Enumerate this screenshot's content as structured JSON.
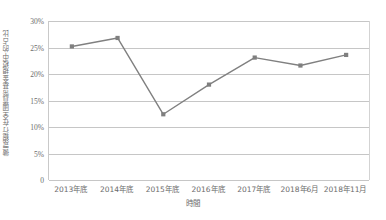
{
  "chart_data": {
    "type": "line",
    "title": "",
    "subtitle": "",
    "xlabel": "時間",
    "ylabel": "微眾銀行在全國貨幣基金規模中的占比",
    "categories": [
      "2013年底",
      "2014年底",
      "2015年底",
      "2016年底",
      "2017年底",
      "2018年6月",
      "2018年11月"
    ],
    "values": [
      25.2,
      26.8,
      12.4,
      18.0,
      23.1,
      21.6,
      23.6
    ],
    "series": [
      {
        "name": "占比",
        "values": [
          25.2,
          26.8,
          12.4,
          18.0,
          23.1,
          21.6,
          23.6
        ]
      }
    ],
    "ylim": [
      0,
      30
    ],
    "ytick_values": [
      0,
      5,
      10,
      15,
      20,
      25,
      30
    ],
    "ytick_labels": [
      "0",
      "5%",
      "10%",
      "15%",
      "20%",
      "25%",
      "30%"
    ],
    "grid": true,
    "legend": false,
    "legend_position": "none",
    "annotations": [],
    "colors": {
      "line": "#808080",
      "marker": "#7f7f7f",
      "gridline": "#c6c6c6",
      "axis": "#c9c9c9",
      "text": "#6b6b6b",
      "background": "#ffffff"
    },
    "marker_style": "square",
    "line_width": 1.4
  }
}
